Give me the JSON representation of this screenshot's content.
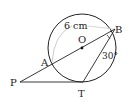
{
  "diagram": {
    "labels": {
      "O": "O",
      "A": "A",
      "B": "B",
      "P": "P",
      "T": "T",
      "radius": "6 cm",
      "angle": "30°"
    },
    "colors": {
      "stroke": "#222222",
      "arc": "#cccccc",
      "background": "#ffffff"
    }
  }
}
